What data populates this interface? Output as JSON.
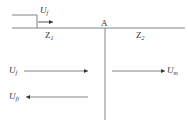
{
  "diagram": {
    "type": "traveling-wave-reflection-refraction",
    "colors": {
      "line": "#555555",
      "background": "#ffffff"
    },
    "junction": {
      "label": "A"
    },
    "lines": [
      {
        "id": "line-1",
        "impedance": {
          "symbol": "Z",
          "subscript": "1"
        }
      },
      {
        "id": "line-2",
        "impedance": {
          "symbol": "Z",
          "subscript": "2"
        }
      }
    ],
    "incident_wavefront": {
      "symbol": "U",
      "subscript": "f",
      "direction": "right"
    },
    "waves": [
      {
        "id": "incident",
        "symbol": "U",
        "subscript": "f",
        "direction": "right",
        "side": "left"
      },
      {
        "id": "reflected",
        "symbol": "U",
        "subscript": "fl",
        "direction": "left",
        "side": "left"
      },
      {
        "id": "transmitted",
        "symbol": "U",
        "subscript": "m",
        "direction": "right",
        "side": "right"
      }
    ]
  }
}
